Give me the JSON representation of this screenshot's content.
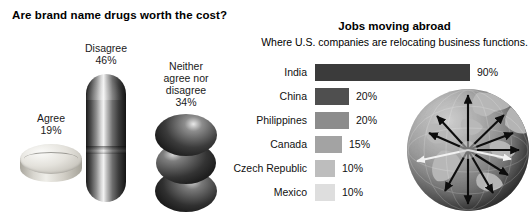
{
  "left_chart": {
    "title": "Are brand name drugs worth the cost?",
    "items": [
      {
        "label": "Agree",
        "value": "19%",
        "icon": "round-tablet-pill-icon"
      },
      {
        "label": "Disagree",
        "value": "46%",
        "icon": "capsule-pill-icon"
      },
      {
        "label": "Neither\nagree nor\ndisagree",
        "value": "34%",
        "icon": "stacked-spheres-pill-icon"
      }
    ],
    "label_agree": "Agree",
    "value_agree": "19%",
    "label_disagree": "Disagree",
    "value_disagree": "46%",
    "label_neither_l1": "Neither",
    "label_neither_l2": "agree nor",
    "label_neither_l3": "disagree",
    "value_neither": "34%"
  },
  "right_chart": {
    "title": "Jobs moving abroad",
    "subtitle": "Where U.S. companies are relocating business functions.",
    "globe_icon": "globe-with-radiating-arrows-icon"
  },
  "chart_data": [
    {
      "type": "pie",
      "title": "Are brand name drugs worth the cost?",
      "categories": [
        "Agree",
        "Disagree",
        "Neither agree nor disagree"
      ],
      "values": [
        19,
        46,
        34
      ],
      "value_labels": [
        "19%",
        "46%",
        "34%"
      ],
      "unit": "%",
      "legend": "inline-labels",
      "note": "Pictorial chart: each share drawn as a 3-D pill graphic rather than a pie slice."
    },
    {
      "type": "bar",
      "orientation": "horizontal",
      "title": "Jobs moving abroad",
      "subtitle": "Where U.S. companies are relocating business functions.",
      "xlabel": "",
      "ylabel": "",
      "xlim": [
        0,
        90
      ],
      "grid": false,
      "legend": "none",
      "categories": [
        "India",
        "China",
        "Philippines",
        "Canada",
        "Czech Republic",
        "Mexico"
      ],
      "values": [
        90,
        20,
        20,
        15,
        10,
        10
      ],
      "value_labels": [
        "90%",
        "20%",
        "20%",
        "15%",
        "10%",
        "10%"
      ],
      "bar_colors": [
        "#3b3b3b",
        "#4f4f4f",
        "#8c8c8c",
        "#a3a3a3",
        "#bdbdbd",
        "#dedede"
      ],
      "unit": "%"
    }
  ],
  "bars": [
    {
      "category": "India",
      "value_label": "90%",
      "width_px": 155,
      "color": "#3b3b3b"
    },
    {
      "category": "China",
      "value_label": "20%",
      "width_px": 34,
      "color": "#4f4f4f"
    },
    {
      "category": "Philippines",
      "value_label": "20%",
      "width_px": 34,
      "color": "#8c8c8c"
    },
    {
      "category": "Canada",
      "value_label": "15%",
      "width_px": 27,
      "color": "#a3a3a3"
    },
    {
      "category": "Czech Republic",
      "value_label": "10%",
      "width_px": 20,
      "color": "#bdbdbd"
    },
    {
      "category": "Mexico",
      "value_label": "10%",
      "width_px": 20,
      "color": "#dedede"
    }
  ]
}
